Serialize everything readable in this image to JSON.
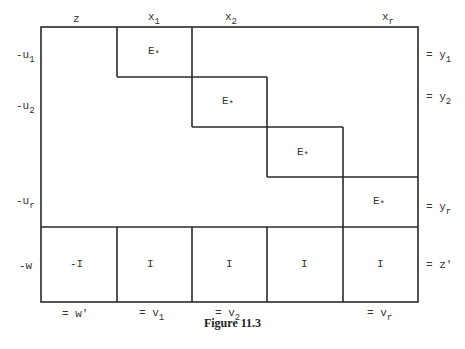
{
  "figure": {
    "caption": "Figure 11.3",
    "column_headers": [
      {
        "base": "z",
        "sub": ""
      },
      {
        "base": "x",
        "sub": "1"
      },
      {
        "base": "x",
        "sub": "2"
      },
      {
        "base": "x",
        "sub": "r"
      }
    ],
    "row_labels_left": [
      {
        "base": "-u",
        "sub": "1"
      },
      {
        "base": "-u",
        "sub": "2"
      },
      {
        "base": "-u",
        "sub": "r"
      },
      {
        "base": "-w",
        "sub": ""
      }
    ],
    "row_labels_right": [
      {
        "base": "= y",
        "sub": "1"
      },
      {
        "base": "= y",
        "sub": "2"
      },
      {
        "base": "= y",
        "sub": "r"
      },
      {
        "base": "= z'",
        "sub": ""
      }
    ],
    "bottom_labels": [
      {
        "base": "= w'",
        "sub": ""
      },
      {
        "base": "= v",
        "sub": "1"
      },
      {
        "base": "= v",
        "sub": "2"
      },
      {
        "base": "= v",
        "sub": "r"
      }
    ],
    "diagonal_blocks": [
      {
        "base": "E",
        "sub": "*"
      },
      {
        "base": "E",
        "sub": "*"
      },
      {
        "base": "E",
        "sub": "*"
      },
      {
        "base": "E",
        "sub": "*"
      }
    ],
    "bottom_row_cells": [
      "-I",
      "I",
      "I",
      "I",
      "I"
    ],
    "line_color": "#2a2a2a"
  }
}
